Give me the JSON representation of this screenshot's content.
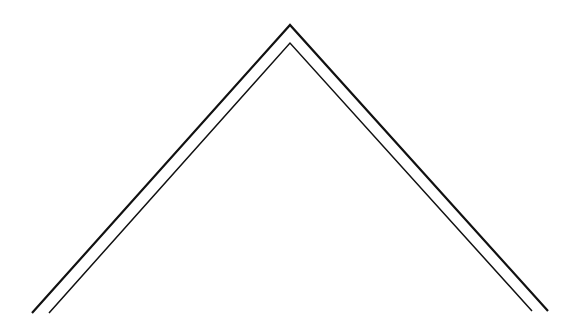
{
  "diagram": {
    "description": "Two nested chevron (roof-shaped) lines",
    "background": "#ffffff",
    "stroke_color": "#111111",
    "shapes": [
      {
        "name": "outer-chevron",
        "points": [
          [
            32,
            313
          ],
          [
            290,
            25
          ],
          [
            548,
            311
          ]
        ],
        "stroke_width": 2.2
      },
      {
        "name": "inner-chevron",
        "points": [
          [
            49,
            313
          ],
          [
            290,
            43
          ],
          [
            532,
            311
          ]
        ],
        "stroke_width": 1.5
      }
    ]
  }
}
